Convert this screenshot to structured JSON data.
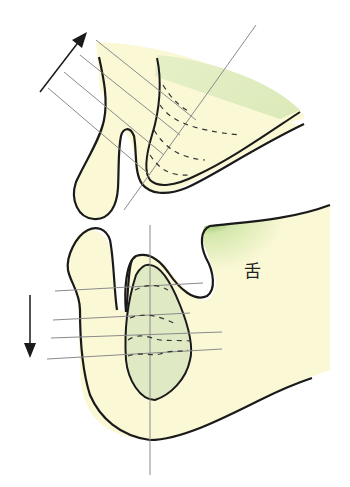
{
  "figure": {
    "type": "anatomical-diagram",
    "labels": {
      "tongue": "舌"
    },
    "upper_jaw": {
      "arrow_direction": "up-left",
      "parallel_lines": 4,
      "dashed_contours": 4
    },
    "lower_jaw": {
      "arrow_direction": "down",
      "parallel_lines": 4,
      "dashed_contours": 4
    },
    "colors": {
      "bone_fill": "#fbf8d6",
      "root_fill": "#dfe9c4",
      "tongue_edge": "#5aa02c",
      "outline": "#1a1a1a",
      "guide_line": "#8a8a8a"
    }
  }
}
